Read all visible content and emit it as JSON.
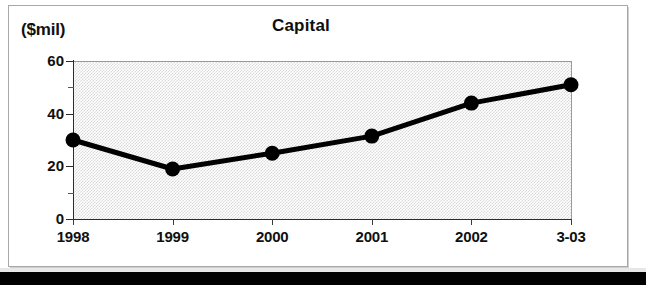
{
  "figure": {
    "y_unit_label": "($mil)",
    "title": "Capital"
  },
  "chart_data": {
    "type": "line",
    "title": "Capital",
    "subtitle": "",
    "xlabel": "",
    "ylabel": "($mil)",
    "ylim": [
      0,
      60
    ],
    "y_ticks_major": [
      0,
      20,
      40,
      60
    ],
    "y_ticks_minor": [
      10,
      30,
      50
    ],
    "grid": false,
    "legend": "none",
    "plot_background": "#d9d9d9",
    "series_color": "#000000",
    "marker": "filled-circle",
    "categories": [
      "1998",
      "1999",
      "2000",
      "2001",
      "2002",
      "3-03"
    ],
    "values": [
      30,
      19,
      25,
      31.5,
      44,
      51
    ],
    "series": [
      {
        "name": "Capital",
        "values": [
          30,
          19,
          25,
          31.5,
          44,
          51
        ]
      }
    ],
    "points": [
      {
        "x_label": "1998",
        "y": 30
      },
      {
        "x_label": "1999",
        "y": 19
      },
      {
        "x_label": "2000",
        "y": 25
      },
      {
        "x_label": "2001",
        "y": 31.5
      },
      {
        "x_label": "2002",
        "y": 44
      },
      {
        "x_label": "3-03",
        "y": 51
      }
    ]
  }
}
